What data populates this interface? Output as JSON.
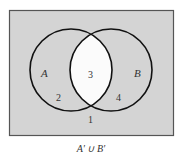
{
  "diagram": {
    "type": "venn",
    "sets": [
      {
        "name": "A",
        "label": "A"
      },
      {
        "name": "B",
        "label": "B"
      }
    ],
    "regions": [
      {
        "id": "outside",
        "number": "1",
        "shaded": true
      },
      {
        "id": "A-only",
        "number": "2",
        "shaded": true
      },
      {
        "id": "A-and-B",
        "number": "3",
        "shaded": false
      },
      {
        "id": "B-only",
        "number": "4",
        "shaded": true
      }
    ],
    "caption": "A′ ∪ B′",
    "colors": {
      "shade": "#d4d4d4",
      "unshaded": "#fbfbfb",
      "outline": "#111111",
      "frame": "#555555"
    }
  }
}
